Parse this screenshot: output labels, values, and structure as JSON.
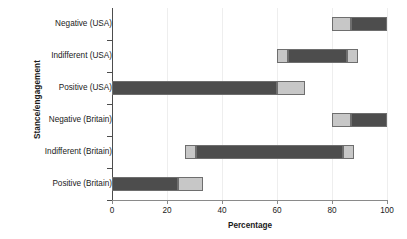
{
  "chart": {
    "type": "bar",
    "orientation": "horizontal",
    "xlabel": "Percentage",
    "ylabel": "Stance/engagement",
    "title": ""
  },
  "axes": {
    "x_ticks": [
      "0",
      "20",
      "40",
      "60",
      "80",
      "100"
    ],
    "x_tick_values": [
      0,
      20,
      40,
      60,
      80,
      100
    ],
    "xlim": [
      0,
      100
    ],
    "grid": "vertical-light"
  },
  "colors": {
    "dark_segment": "#4d4d4d",
    "light_segment": "#c7c7c7",
    "segment_border": "#6e6e6e",
    "axis": "#4d4d4d",
    "gridline": "#eeeeee",
    "text": "#1a1a1a",
    "background": "#ffffff"
  },
  "chart_data": {
    "type": "bar",
    "orientation": "horizontal",
    "title": "",
    "xlabel": "Percentage",
    "ylabel": "Stance/engagement",
    "xlim": [
      0,
      100
    ],
    "ylim": [
      0,
      6
    ],
    "grid": true,
    "legend": "none",
    "categories": [
      "Negative (USA)",
      "Indifferent (USA)",
      "Positive (USA)",
      "Negative (Britain)",
      "Indifferent (Britain)",
      "Positive (Britain)"
    ],
    "note": "Each category is a floating/range bar made of stacked segments drawn from 'start' to 'end' on the percentage axis; 'shade' is dark or light.",
    "bars": [
      {
        "category": "Negative (USA)",
        "range": [
          80,
          100
        ],
        "segments": [
          {
            "start": 80,
            "end": 87,
            "shade": "light"
          },
          {
            "start": 87,
            "end": 100,
            "shade": "dark"
          }
        ]
      },
      {
        "category": "Indifferent (USA)",
        "range": [
          60,
          89.5
        ],
        "segments": [
          {
            "start": 60,
            "end": 64,
            "shade": "light"
          },
          {
            "start": 64,
            "end": 85.5,
            "shade": "dark"
          },
          {
            "start": 85.5,
            "end": 89.5,
            "shade": "light"
          }
        ]
      },
      {
        "category": "Positive (USA)",
        "range": [
          0,
          70
        ],
        "segments": [
          {
            "start": 0,
            "end": 60,
            "shade": "dark"
          },
          {
            "start": 60,
            "end": 70,
            "shade": "light"
          }
        ]
      },
      {
        "category": "Negative (Britain)",
        "range": [
          80,
          100
        ],
        "segments": [
          {
            "start": 80,
            "end": 87,
            "shade": "light"
          },
          {
            "start": 87,
            "end": 100,
            "shade": "dark"
          }
        ]
      },
      {
        "category": "Indifferent (Britain)",
        "range": [
          26.5,
          88
        ],
        "segments": [
          {
            "start": 26.5,
            "end": 30.5,
            "shade": "light"
          },
          {
            "start": 30.5,
            "end": 84,
            "shade": "dark"
          },
          {
            "start": 84,
            "end": 88,
            "shade": "light"
          }
        ]
      },
      {
        "category": "Positive (Britain)",
        "range": [
          0,
          33
        ],
        "segments": [
          {
            "start": 0,
            "end": 24,
            "shade": "dark"
          },
          {
            "start": 24,
            "end": 33,
            "shade": "light"
          }
        ]
      }
    ]
  }
}
